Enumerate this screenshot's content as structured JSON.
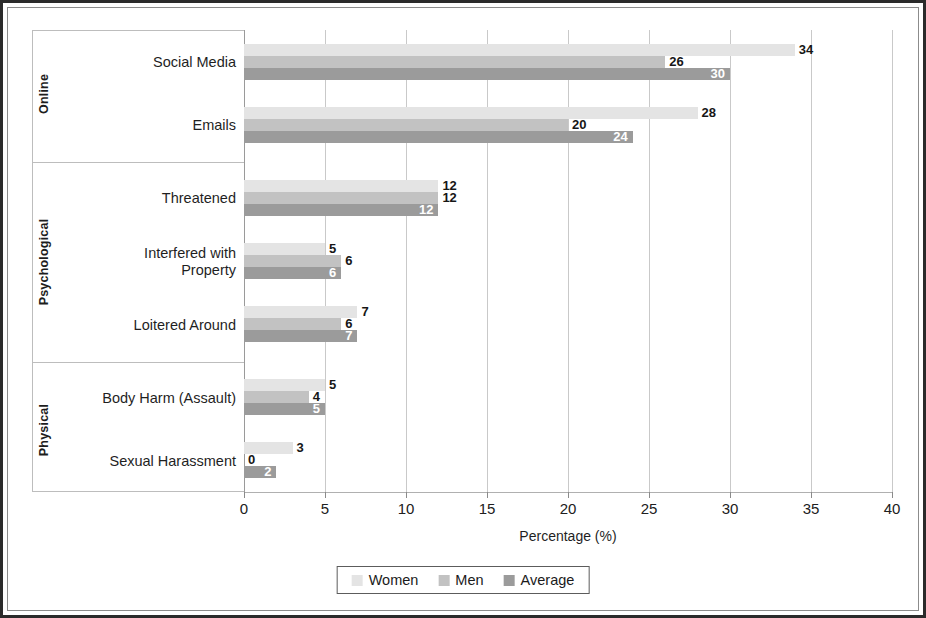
{
  "chart_data": {
    "type": "bar",
    "orientation": "horizontal",
    "title": "",
    "xlabel": "Percentage (%)",
    "ylabel": "",
    "xlim": [
      0,
      40
    ],
    "xticks": [
      0,
      5,
      10,
      15,
      20,
      25,
      30,
      35,
      40
    ],
    "xtick_labels": [
      "0",
      "5",
      "10",
      "15",
      "20",
      "25",
      "30",
      "35",
      "40"
    ],
    "grid": "vertical",
    "legend_position": "bottom-center",
    "legend_entries": [
      "Women",
      "Men",
      "Average"
    ],
    "categories": [
      "Social Media",
      "Emails",
      "Threatened",
      "Interfered with\nProperty",
      "Loitered Around",
      "Body Harm (Assault)",
      "Sexual Harassment"
    ],
    "groups": [
      {
        "label": "Online",
        "categories": [
          "Social Media",
          "Emails"
        ]
      },
      {
        "label": "Psychological",
        "categories": [
          "Threatened",
          "Interfered with Property",
          "Loitered Around"
        ]
      },
      {
        "label": "Physical",
        "categories": [
          "Body Harm (Assault)",
          "Sexual Harassment"
        ]
      }
    ],
    "series": [
      {
        "name": "Women",
        "color": "#e4e4e4",
        "values": [
          34,
          28,
          12,
          5,
          7,
          5,
          3
        ]
      },
      {
        "name": "Men",
        "color": "#c2c2c2",
        "values": [
          26,
          20,
          12,
          6,
          6,
          4,
          0
        ]
      },
      {
        "name": "Average",
        "color": "#9b9b9b",
        "values": [
          30,
          24,
          12,
          6,
          7,
          5,
          2
        ]
      }
    ],
    "data_labels": {
      "Social Media": {
        "Women": "34",
        "Men": "26",
        "Average": "30"
      },
      "Emails": {
        "Women": "28",
        "Men": "20",
        "Average": "24"
      },
      "Threatened": {
        "Women": "12",
        "Men": "12",
        "Average": "12"
      },
      "Interfered with Property": {
        "Women": "5",
        "Men": "6",
        "Average": "6"
      },
      "Loitered Around": {
        "Women": "7",
        "Men": "6",
        "Average": "7"
      },
      "Body Harm (Assault)": {
        "Women": "5",
        "Men": "4",
        "Average": "5"
      },
      "Sexual Harassment": {
        "Women": "3",
        "Men": "0",
        "Average": "2"
      }
    }
  },
  "axis": {
    "x_title": "Percentage (%)"
  },
  "legend": {
    "items": [
      {
        "label": "Women"
      },
      {
        "label": "Men"
      },
      {
        "label": "Average"
      }
    ]
  },
  "groups": [
    {
      "label": "Online"
    },
    {
      "label": "Psychological"
    },
    {
      "label": "Physical"
    }
  ],
  "categories": [
    {
      "label": "Social Media"
    },
    {
      "label": "Emails"
    },
    {
      "label": "Threatened"
    },
    {
      "label": "Interfered with\nProperty"
    },
    {
      "label": "Loitered Around"
    },
    {
      "label": "Body Harm (Assault)"
    },
    {
      "label": "Sexual Harassment"
    }
  ],
  "xticks": [
    {
      "label": "0"
    },
    {
      "label": "5"
    },
    {
      "label": "10"
    },
    {
      "label": "15"
    },
    {
      "label": "20"
    },
    {
      "label": "25"
    },
    {
      "label": "30"
    },
    {
      "label": "35"
    },
    {
      "label": "40"
    }
  ]
}
